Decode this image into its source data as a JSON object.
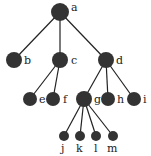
{
  "diagram": {
    "type": "tree",
    "node_color": "#333333",
    "edge_color": "#222222",
    "nodes": [
      {
        "id": "a",
        "label": "a",
        "x": 60,
        "y": 12,
        "r": 9,
        "lx": 71,
        "ly": 11
      },
      {
        "id": "b",
        "label": "b",
        "x": 14,
        "y": 60,
        "r": 8,
        "lx": 24,
        "ly": 64
      },
      {
        "id": "c",
        "label": "c",
        "x": 60,
        "y": 60,
        "r": 8,
        "lx": 71,
        "ly": 64
      },
      {
        "id": "d",
        "label": "d",
        "x": 106,
        "y": 60,
        "r": 8,
        "lx": 116,
        "ly": 64
      },
      {
        "id": "e",
        "label": "e",
        "x": 30,
        "y": 99,
        "r": 7,
        "lx": 39,
        "ly": 103
      },
      {
        "id": "f",
        "label": "f",
        "x": 53,
        "y": 99,
        "r": 7,
        "lx": 63,
        "ly": 103
      },
      {
        "id": "g",
        "label": "g",
        "x": 84,
        "y": 99,
        "r": 8,
        "lx": 94,
        "ly": 103
      },
      {
        "id": "h",
        "label": "h",
        "x": 108,
        "y": 99,
        "r": 7,
        "lx": 117,
        "ly": 103
      },
      {
        "id": "i",
        "label": "i",
        "x": 134,
        "y": 99,
        "r": 7,
        "lx": 143,
        "ly": 103
      },
      {
        "id": "j",
        "label": "j",
        "x": 64,
        "y": 136,
        "r": 5,
        "lx": 61,
        "ly": 152
      },
      {
        "id": "k",
        "label": "k",
        "x": 80,
        "y": 136,
        "r": 5,
        "lx": 76,
        "ly": 152
      },
      {
        "id": "l",
        "label": "l",
        "x": 96,
        "y": 136,
        "r": 5,
        "lx": 94,
        "ly": 152
      },
      {
        "id": "m",
        "label": "m",
        "x": 113,
        "y": 136,
        "r": 5,
        "lx": 107,
        "ly": 152
      }
    ],
    "edges": [
      [
        "a",
        "b"
      ],
      [
        "a",
        "c"
      ],
      [
        "a",
        "d"
      ],
      [
        "c",
        "e"
      ],
      [
        "c",
        "f"
      ],
      [
        "d",
        "g"
      ],
      [
        "d",
        "h"
      ],
      [
        "d",
        "i"
      ],
      [
        "g",
        "j"
      ],
      [
        "g",
        "k"
      ],
      [
        "g",
        "l"
      ],
      [
        "g",
        "m"
      ]
    ]
  }
}
